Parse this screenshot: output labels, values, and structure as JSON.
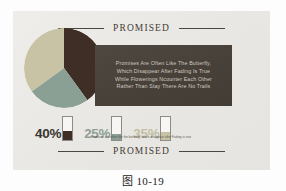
{
  "figure": {
    "caption": "图 10-19"
  },
  "card": {
    "header_brand": "PROMISED",
    "footer_brand": "PROMISED",
    "background_color": "#eceae7",
    "mini_caption": "Promises are often like the butterfly, which disappear after Fading is true."
  },
  "quote": {
    "lines": [
      "Promises Are Often Like The Butterfly,",
      "Which Disappear After Fading Is True",
      "While Flowerings Ncounter Each Other",
      "Rather Than Stay  There Are No Trails"
    ],
    "panel_color": "#4a433c",
    "text_color": "#cfc9c0"
  },
  "stats": [
    {
      "label": "40%",
      "value": 40,
      "color": "#3e2e25",
      "text_color": "#3a3631"
    },
    {
      "label": "25%",
      "value": 25,
      "color": "#8aa094",
      "text_color": "#8fa096"
    },
    {
      "label": "35%",
      "value": 35,
      "color": "#c9c3a6",
      "text_color": "#c2bda3"
    }
  ],
  "chart_data": {
    "type": "pie",
    "title": "PROMISED",
    "labels": [
      "40%",
      "25%",
      "35%"
    ],
    "values": [
      40,
      25,
      35
    ],
    "colors": [
      "#3e2e25",
      "#8aa094",
      "#c9c3a6"
    ],
    "legend": "none",
    "start_angle_deg": 0
  }
}
